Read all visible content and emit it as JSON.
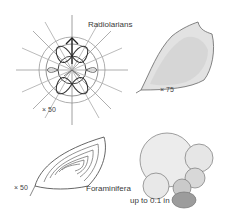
{
  "labels": {
    "radiolarians": "Radiolarians",
    "foraminifera": "Foraminifera",
    "size_note": "up to 0.1 in"
  },
  "scales": {
    "radiolarian_sphere": "× 50",
    "radiolarian_cone": "× 75",
    "foraminifera_fan": "× 50"
  },
  "colors": {
    "ink": "#333333",
    "light_ink": "#8a8a8a",
    "background": "#ffffff"
  }
}
